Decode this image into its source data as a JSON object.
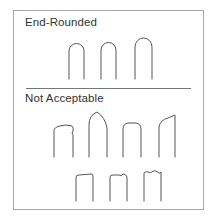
{
  "sections": [
    {
      "title": "End-Rounded",
      "shapes": [
        "rounded-end-1",
        "rounded-end-2",
        "rounded-end-3"
      ]
    },
    {
      "title": "Not Acceptable",
      "shapes": [
        "flat-dented",
        "pointed",
        "square-rounded-corners",
        "slanted",
        "flat-square",
        "notched",
        "double-notched"
      ]
    }
  ],
  "colors": {
    "stroke": "#555555",
    "border": "#a9a9a9",
    "text": "#333333"
  }
}
